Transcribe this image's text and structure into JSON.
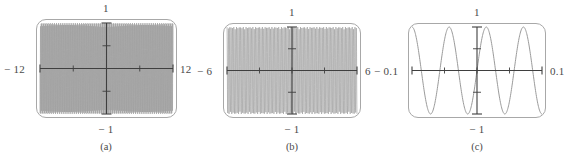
{
  "figure": {
    "panel_count": 3,
    "background": "#ffffff",
    "frame_color": "#a8a8a8",
    "curve_color": "#9b9b9b",
    "axis_color": "#3f3f3f",
    "text_color": "#4a4a4a"
  },
  "panels": [
    {
      "caption": "(a)",
      "x_left_label": "− 12",
      "x_right_label": "12",
      "y_top_label": "1",
      "y_bottom_label": "− 1",
      "frame": {
        "x": 36,
        "y": 19,
        "w": 141,
        "h": 99
      },
      "caption_x": 106,
      "caption_y": 141,
      "chart_data": {
        "type": "line",
        "title": "(a)",
        "xlabel": "",
        "ylabel": "",
        "xlim": [
          -12,
          12
        ],
        "ylim": [
          -1,
          1
        ],
        "x_ticks": [
          -12,
          -6,
          0,
          6,
          12
        ],
        "x_tick_labels": [
          "− 12",
          "",
          "",
          "",
          "12"
        ],
        "y_ticks": [
          -1,
          -0.5,
          0,
          0.5,
          1
        ],
        "y_tick_labels": [
          "− 1",
          "",
          "",
          "",
          "1"
        ],
        "grid": false,
        "legend": "none",
        "series": [
          {
            "name": "sin(50x)",
            "expression": "sin(50*x)",
            "samples": 1400,
            "note": "densely aliased oscillation filling the frame"
          }
        ],
        "annotation": "Aliased high-frequency sine plotted over a wide window; appears as a solid band of vertical strokes."
      }
    },
    {
      "caption": "(b)",
      "x_left_label": "− 6",
      "x_right_label": "6",
      "y_top_label": "1",
      "y_bottom_label": "− 1",
      "frame": {
        "x": 223,
        "y": 23,
        "w": 138,
        "h": 95
      },
      "caption_x": 292,
      "caption_y": 141,
      "chart_data": {
        "type": "line",
        "title": "(b)",
        "xlabel": "",
        "ylabel": "",
        "xlim": [
          -6,
          6
        ],
        "ylim": [
          -1,
          1
        ],
        "x_ticks": [
          -6,
          -3,
          0,
          3,
          6
        ],
        "x_tick_labels": [
          "− 6",
          "",
          "",
          "",
          "6"
        ],
        "y_ticks": [
          -1,
          -0.5,
          0,
          0.5,
          1
        ],
        "y_tick_labels": [
          "− 1",
          "",
          "",
          "",
          "1"
        ],
        "grid": false,
        "legend": "none",
        "series": [
          {
            "name": "sin(50x)",
            "expression": "sin(50*x)",
            "samples": 900,
            "note": "oscillation resolved into discrete vertical strokes"
          }
        ],
        "annotation": "Same function over half the window; individual oscillation strokes become separable."
      }
    },
    {
      "caption": "(c)",
      "x_left_label": "− 0.1",
      "x_right_label": "0.1",
      "y_top_label": "1",
      "y_bottom_label": "− 1",
      "frame": {
        "x": 408,
        "y": 23,
        "w": 138,
        "h": 95
      },
      "caption_x": 477,
      "caption_y": 141,
      "chart_data": {
        "type": "line",
        "title": "(c)",
        "xlabel": "",
        "ylabel": "",
        "xlim": [
          -0.1,
          0.1
        ],
        "ylim": [
          -1,
          1
        ],
        "x_ticks": [
          -0.1,
          -0.05,
          0,
          0.05,
          0.1
        ],
        "x_tick_labels": [
          "− 0.1",
          "",
          "",
          "",
          "0.1"
        ],
        "y_ticks": [
          -1,
          -0.5,
          0,
          0.5,
          1
        ],
        "y_tick_labels": [
          "− 1",
          "",
          "",
          "",
          "1"
        ],
        "grid": false,
        "legend": "none",
        "series": [
          {
            "name": "sin(110x)",
            "expression": "sin(110*x)",
            "samples": 400,
            "periods_visible": 3.5,
            "note": "smooth sine resolved at close zoom"
          }
        ],
        "annotation": "Zoomed view reveals about three and a half smooth sine periods spanning the frame."
      }
    }
  ]
}
